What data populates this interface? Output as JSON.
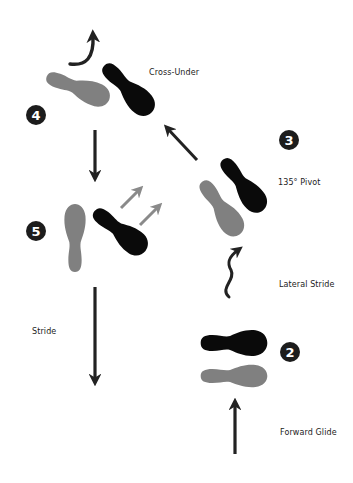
{
  "diagram": {
    "steps": [
      {
        "number": "2",
        "label": "Forward Glide",
        "secondary_label": "Lateral Stride"
      },
      {
        "number": "3",
        "label": "135° Pivot"
      },
      {
        "number": "4",
        "label": "Cross-Under"
      },
      {
        "number": "5",
        "label": "Stride"
      }
    ],
    "labels": {
      "cross_under": "Cross-Under",
      "pivot": "135° Pivot",
      "lateral_stride": "Lateral Stride",
      "forward_glide": "Forward Glide",
      "stride": "Stride"
    },
    "badges": {
      "two": "2",
      "three": "3",
      "four": "4",
      "five": "5"
    },
    "colors": {
      "left_foot": "#808080",
      "right_foot": "#0a0a0a",
      "arrow": "#222222",
      "secondary_arrow": "#8a8a8a",
      "badge_bg": "#1c1c1c",
      "badge_text": "#ffffff",
      "background": "#ffffff"
    },
    "icons": [
      "footprint-gray",
      "footprint-black",
      "arrow-straight",
      "arrow-curved",
      "arrow-wavy"
    ]
  }
}
